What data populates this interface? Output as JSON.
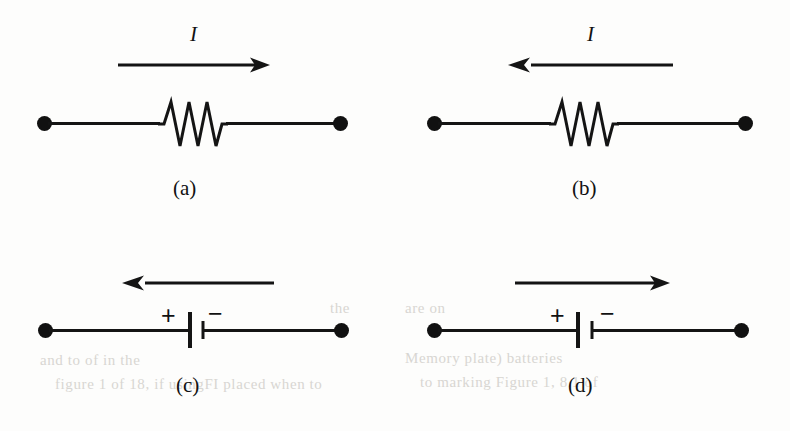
{
  "figure": {
    "background_color": "#fdfdfc",
    "ink_color": "#111111",
    "width": 790,
    "height": 431
  },
  "panels": [
    {
      "id": "a",
      "caption": "(a)",
      "element_type": "resistor",
      "element_name": "resistor-zigzag",
      "current_label": "I",
      "has_current_label": true,
      "arrow_direction": "right",
      "arrow_name": "current-arrow-right",
      "terminals": 2,
      "polarity_left": "",
      "polarity_right": ""
    },
    {
      "id": "b",
      "caption": "(b)",
      "element_type": "resistor",
      "element_name": "resistor-zigzag",
      "current_label": "I",
      "has_current_label": true,
      "arrow_direction": "left",
      "arrow_name": "current-arrow-left",
      "terminals": 2,
      "polarity_left": "",
      "polarity_right": ""
    },
    {
      "id": "c",
      "caption": "(c)",
      "element_type": "battery",
      "element_name": "battery-cell",
      "current_label": "",
      "has_current_label": false,
      "arrow_direction": "left",
      "arrow_name": "current-arrow-left",
      "terminals": 2,
      "polarity_left": "+",
      "polarity_right": "−"
    },
    {
      "id": "d",
      "caption": "(d)",
      "element_type": "battery",
      "element_name": "battery-cell",
      "current_label": "",
      "has_current_label": false,
      "arrow_direction": "right",
      "arrow_name": "current-arrow-right",
      "terminals": 2,
      "polarity_left": "+",
      "polarity_right": "−"
    }
  ],
  "bleed_through": [
    {
      "text": "and to of in the",
      "x": 40,
      "y": 352
    },
    {
      "text": "Memory plate) batteries",
      "x": 405,
      "y": 350
    },
    {
      "text": "figure 1 of 18, if usingFI placed when to",
      "x": 55,
      "y": 376
    },
    {
      "text": "to marking  Figure 1, 8.1 of",
      "x": 420,
      "y": 374
    },
    {
      "text": "the",
      "x": 330,
      "y": 300
    },
    {
      "text": "are on",
      "x": 405,
      "y": 300
    }
  ]
}
